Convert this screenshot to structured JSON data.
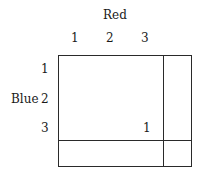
{
  "table": {
    "column_variable": "Red",
    "row_variable": "Blue",
    "column_labels": [
      "1",
      "2",
      "3"
    ],
    "row_labels": [
      "1",
      "2",
      "3"
    ],
    "cells": [
      [
        "",
        "",
        ""
      ],
      [
        "",
        "",
        ""
      ],
      [
        "",
        "",
        "1"
      ]
    ],
    "row_totals": [
      "",
      "",
      ""
    ],
    "column_totals": [
      "",
      "",
      ""
    ],
    "grand_total": ""
  }
}
